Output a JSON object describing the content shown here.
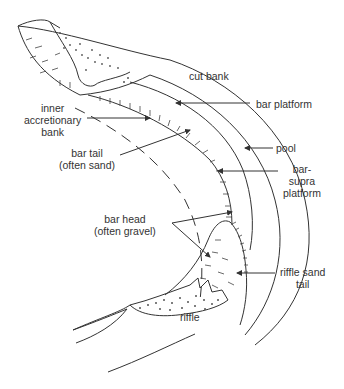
{
  "figure": {
    "type": "point bar / meander bend morphology diagram",
    "labels": {
      "cut_bank": "cut bank",
      "bar_platform": "bar platform",
      "inner_accretionary_bank": [
        "inner",
        "accretionary",
        "bank"
      ],
      "bar_tail": [
        "bar tail",
        "(often sand)"
      ],
      "pool": "pool",
      "bar_supra_platform": [
        "bar-",
        "supra",
        "platform"
      ],
      "bar_head": [
        "bar head",
        "(often gravel)"
      ],
      "riffle_sand_tail": [
        "riffle sand",
        "tail"
      ],
      "riffle": "riffle"
    },
    "colors": {
      "line": "#333333",
      "text": "#333333",
      "background": "#ffffff"
    }
  }
}
